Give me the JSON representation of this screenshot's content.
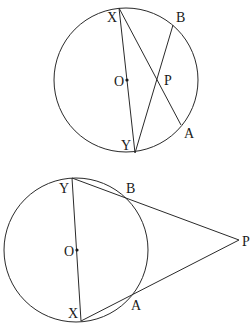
{
  "figures": [
    {
      "id": "top",
      "description": "Two chords XA and YB intersecting at P inside circle with centre O; XY is a diameter",
      "circle": {
        "cx": 126,
        "cy": 80,
        "r": 72
      },
      "points": {
        "X": {
          "x": 119,
          "y": 8,
          "label": "X",
          "lx": 107,
          "ly": 22
        },
        "B": {
          "x": 173,
          "y": 25,
          "label": "B",
          "lx": 176,
          "ly": 22
        },
        "O": {
          "x": 127,
          "y": 80,
          "label": "O",
          "lx": 114,
          "ly": 86
        },
        "P": {
          "x": 156,
          "y": 79,
          "label": "P",
          "lx": 164,
          "ly": 85
        },
        "A": {
          "x": 181,
          "y": 125,
          "label": "A",
          "lx": 184,
          "ly": 138
        },
        "Y": {
          "x": 135,
          "y": 153,
          "label": "Y",
          "lx": 121,
          "ly": 150
        }
      },
      "segments": [
        [
          "X",
          "Y"
        ],
        [
          "X",
          "A"
        ],
        [
          "Y",
          "B"
        ]
      ]
    },
    {
      "id": "bottom",
      "description": "Secants PB-Y and PA-X from external point P to circle with centre O; XY is a diameter",
      "circle": {
        "cx": 76,
        "cy": 250,
        "r": 72
      },
      "points": {
        "Y": {
          "x": 72,
          "y": 178,
          "label": "Y",
          "lx": 59,
          "ly": 193
        },
        "B": {
          "x": 124,
          "y": 194,
          "label": "B",
          "lx": 126,
          "ly": 193
        },
        "O": {
          "x": 77,
          "y": 250,
          "label": "O",
          "lx": 64,
          "ly": 256
        },
        "P": {
          "x": 239,
          "y": 240,
          "label": "P",
          "lx": 242,
          "ly": 246
        },
        "A": {
          "x": 129,
          "y": 296,
          "label": "A",
          "lx": 131,
          "ly": 310
        },
        "X": {
          "x": 81,
          "y": 321,
          "label": "X",
          "lx": 68,
          "ly": 318
        }
      },
      "segments": [
        [
          "Y",
          "X"
        ],
        [
          "Y",
          "P"
        ],
        [
          "X",
          "P"
        ]
      ]
    }
  ],
  "colors": {
    "line": "#2a2a2a",
    "text": "#1a1a1a",
    "background": "#ffffff"
  }
}
